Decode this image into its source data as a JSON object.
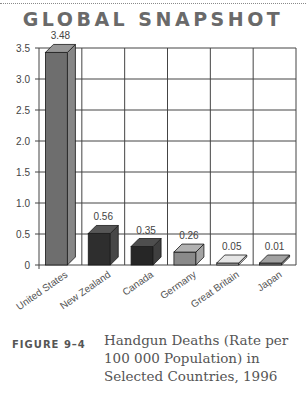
{
  "header": {
    "title": "GLOBAL SNAPSHOT"
  },
  "figure": {
    "label": "FIGURE 9–4",
    "caption": "Handgun Deaths (Rate per 100 000 Population) in Selected Countries, 1996"
  },
  "colors": {
    "us": "#6e6e6e",
    "nz": "#2e2e2e",
    "canada": "#262626",
    "germany": "#8a8a8a",
    "great_britain": "#bdbdbd",
    "japan": "#7a7a7a",
    "grid": "#444444"
  },
  "chart_data": {
    "type": "bar",
    "title": "GLOBAL SNAPSHOT",
    "subtitle": "Handgun Deaths (Rate per 100 000 Population) in Selected Countries, 1996",
    "categories": [
      "United States",
      "New Zealand",
      "Canada",
      "Germany",
      "Great Britain",
      "Japan"
    ],
    "values": [
      3.48,
      0.56,
      0.35,
      0.26,
      0.05,
      0.01
    ],
    "data_labels": [
      "3.48",
      "0.56",
      "0.35",
      "0.26",
      "0.05",
      "0.01"
    ],
    "xlabel": "",
    "ylabel": "",
    "ylim": [
      0,
      3.5
    ],
    "yticks": [
      "0",
      "0.5",
      "1.0",
      "1.5",
      "2.0",
      "2.5",
      "3.0",
      "3.5"
    ],
    "grid": true,
    "legend": null,
    "style": "3d-bars"
  }
}
